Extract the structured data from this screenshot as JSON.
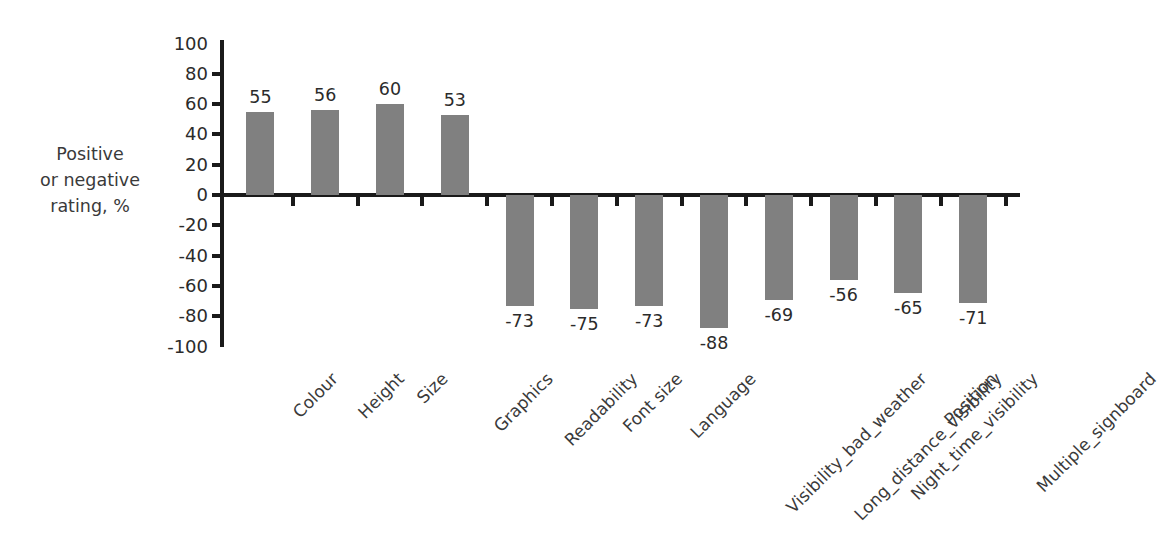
{
  "chart_data": {
    "type": "bar",
    "title": "",
    "xlabel": "",
    "ylabel": "Positive or negative rating, %",
    "ylabel_lines": [
      "Positive",
      "or negative",
      "rating, %"
    ],
    "ylim": [
      -100,
      100
    ],
    "ytick_step": 20,
    "grid": false,
    "legend": "none",
    "bar_color": "#808080",
    "axis_color": "#1a1a1a",
    "categories": [
      "Colour",
      "Height",
      "Size",
      "Graphics",
      "Readability",
      "Font size",
      "Language",
      "Visibility_bad_weather",
      "Long_distance_visibility",
      "Night_time_visibility",
      "Position",
      "Multiple_signboard"
    ],
    "values": [
      55,
      56,
      60,
      53,
      -73,
      -75,
      -73,
      -88,
      -69,
      -56,
      -65,
      -71
    ],
    "value_labels": [
      "55",
      "56",
      "60",
      "53",
      "-73",
      "-75",
      "-73",
      "-88",
      "-69",
      "-56",
      "-65",
      "-71"
    ],
    "ytick_labels": [
      "100",
      "80",
      "60",
      "40",
      "20",
      "0",
      "-20",
      "-40",
      "-60",
      "-80",
      "-100"
    ],
    "ytick_values": [
      100,
      80,
      60,
      40,
      20,
      0,
      -20,
      -40,
      -60,
      -80,
      -100
    ]
  }
}
